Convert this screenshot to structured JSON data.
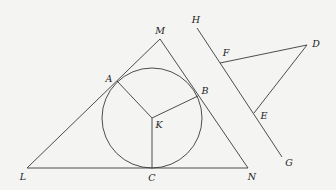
{
  "diagram": {
    "type": "geometry",
    "colors": {
      "background": "#f4f4f2",
      "stroke": "#3a3a3a",
      "text": "#222222"
    },
    "points": {
      "M": {
        "x": 160,
        "y": 39
      },
      "L": {
        "x": 27,
        "y": 168
      },
      "N": {
        "x": 248,
        "y": 168
      },
      "A": {
        "x": 117,
        "y": 81
      },
      "B": {
        "x": 198,
        "y": 96
      },
      "C": {
        "x": 152,
        "y": 168
      },
      "K": {
        "x": 152,
        "y": 118
      },
      "H": {
        "x": 197,
        "y": 28
      },
      "G": {
        "x": 282,
        "y": 157
      },
      "F": {
        "x": 220,
        "y": 63
      },
      "E": {
        "x": 254,
        "y": 113
      },
      "D": {
        "x": 307,
        "y": 45
      }
    },
    "circle": {
      "name": "incircle",
      "center": "K",
      "cx": 152,
      "cy": 118,
      "r": 50
    },
    "segments": [
      [
        "L",
        "M"
      ],
      [
        "M",
        "N"
      ],
      [
        "L",
        "N"
      ],
      [
        "K",
        "A"
      ],
      [
        "K",
        "B"
      ],
      [
        "K",
        "C"
      ],
      [
        "H",
        "G"
      ],
      [
        "F",
        "D"
      ],
      [
        "D",
        "E"
      ]
    ],
    "labels": [
      {
        "text": "M",
        "x": 160,
        "y": 31
      },
      {
        "text": "L",
        "x": 23,
        "y": 177
      },
      {
        "text": "N",
        "x": 252,
        "y": 177
      },
      {
        "text": "A",
        "x": 109,
        "y": 79
      },
      {
        "text": "B",
        "x": 205,
        "y": 91
      },
      {
        "text": "C",
        "x": 152,
        "y": 178
      },
      {
        "text": "K",
        "x": 159,
        "y": 125
      },
      {
        "text": "H",
        "x": 196,
        "y": 20
      },
      {
        "text": "G",
        "x": 289,
        "y": 163
      },
      {
        "text": "F",
        "x": 226,
        "y": 53
      },
      {
        "text": "E",
        "x": 264,
        "y": 116
      },
      {
        "text": "D",
        "x": 316,
        "y": 44
      }
    ]
  }
}
